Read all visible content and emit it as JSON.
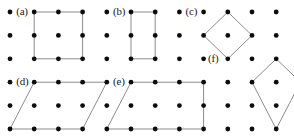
{
  "figure": {
    "name": "dot-lattice-polygons",
    "background_color": "#ffffff",
    "dot_color": "#0d0d0d",
    "line_color": "#8c8c8c",
    "label_color": "#1a1a1a",
    "dot_radius": 2.4,
    "line_width": 1.0,
    "label_font_size": 11
  },
  "lattice": {
    "columns": 12,
    "rows": 6,
    "origin_x": 10,
    "origin_y": 12,
    "spacing_x": 24.2,
    "spacing_y": 23.4,
    "description": "Square array of evenly spaced dots, 12 across and 6 down"
  },
  "labels": [
    {
      "id": "a",
      "text": "(a)",
      "col": 1.0,
      "row": 0,
      "dx": 4,
      "dy": -6
    },
    {
      "id": "b",
      "text": "(b)",
      "col": 5.0,
      "row": 0,
      "dx": 4,
      "dy": -6
    },
    {
      "id": "c",
      "text": "(c)",
      "col": 8.0,
      "row": 0,
      "dx": 4,
      "dy": -6
    },
    {
      "id": "d",
      "text": "(d)",
      "col": 1.0,
      "row": 3,
      "dx": 4,
      "dy": -6
    },
    {
      "id": "e",
      "text": "(e)",
      "col": 5.0,
      "row": 3,
      "dx": 4,
      "dy": -6
    },
    {
      "id": "f",
      "text": "(f)",
      "col": 10.0,
      "row": 2,
      "dx": -22,
      "dy": -6
    }
  ],
  "shapes": [
    {
      "id": "a",
      "name": "square-shape-a",
      "kind": "square",
      "vertices": [
        [
          1,
          0
        ],
        [
          3,
          0
        ],
        [
          3,
          2
        ],
        [
          1,
          2
        ]
      ]
    },
    {
      "id": "b",
      "name": "rectangle-shape-b",
      "kind": "rectangle",
      "vertices": [
        [
          5,
          0
        ],
        [
          6,
          0
        ],
        [
          6,
          2
        ],
        [
          5,
          2
        ]
      ]
    },
    {
      "id": "c",
      "name": "diamond-shape-c",
      "kind": "rotated-square",
      "vertices": [
        [
          9,
          0
        ],
        [
          10,
          1
        ],
        [
          9,
          2
        ],
        [
          8,
          1
        ]
      ]
    },
    {
      "id": "d",
      "name": "parallelogram-shape-d",
      "kind": "parallelogram",
      "vertices": [
        [
          1,
          3
        ],
        [
          4,
          3
        ],
        [
          3,
          5
        ],
        [
          0,
          5
        ]
      ]
    },
    {
      "id": "e",
      "name": "trapezoid-shape-e",
      "kind": "trapezoid",
      "vertices": [
        [
          5,
          3
        ],
        [
          8,
          3
        ],
        [
          8,
          5
        ],
        [
          4,
          5
        ]
      ]
    },
    {
      "id": "f",
      "name": "kite-shape-f",
      "kind": "kite",
      "vertices": [
        [
          11,
          2
        ],
        [
          12,
          3
        ],
        [
          11,
          5
        ],
        [
          10,
          3
        ]
      ]
    }
  ]
}
